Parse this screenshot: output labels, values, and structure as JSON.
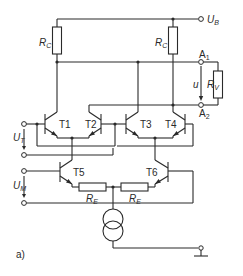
{
  "diagram": {
    "type": "circuit-schematic",
    "figure_label": "a)",
    "supply": {
      "label": "U",
      "sub": "B"
    },
    "resistors": {
      "rc_left": {
        "label": "R",
        "sub": "C"
      },
      "rc_right": {
        "label": "R",
        "sub": "C"
      },
      "rv": {
        "label": "R",
        "sub": "V"
      },
      "re_left": {
        "label": "R",
        "sub": "E"
      },
      "re_right": {
        "label": "R",
        "sub": "E"
      }
    },
    "outputs": {
      "a1": {
        "label": "A",
        "sub": "1"
      },
      "a2": {
        "label": "A",
        "sub": "2"
      },
      "u": {
        "label": "u"
      }
    },
    "inputs": {
      "ut": {
        "label": "U",
        "sub": "T"
      },
      "um": {
        "label": "U",
        "sub": "M"
      }
    },
    "transistors": [
      "T1",
      "T2",
      "T3",
      "T4",
      "T5",
      "T6"
    ],
    "current_source": "constant-current-source",
    "ground": "ground-symbol"
  }
}
